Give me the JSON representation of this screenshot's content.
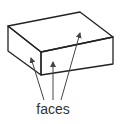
{
  "diagram": {
    "label": "faces",
    "stroke_color": "#222222",
    "arrow_color": "#444444"
  }
}
